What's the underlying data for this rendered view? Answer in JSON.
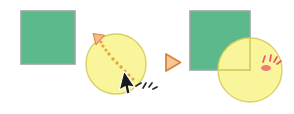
{
  "diagram": {
    "title": "Drag circle onto square corner",
    "type": "before-after-illustration",
    "width": 294,
    "height": 114,
    "background_color": "#ffffff"
  },
  "colors": {
    "square_fill": "#5cb98b",
    "square_stroke": "#9aa79f",
    "circle_fill": "#f9f59a",
    "circle_stroke": "#d8cf63",
    "trail_dot": "#e8a33d",
    "arrowhead": "#f0a35e",
    "cursor_fill": "#1a1a1a",
    "cursor_stroke": "#ffffff",
    "separator_fill": "#f6c28a",
    "separator_stroke": "#d4873c",
    "impact_mark": "#e8556b",
    "motion_mark": "#2b2b2b",
    "quadrant_line": "#cfc45e"
  },
  "before_panel": {
    "label": "before",
    "square": {
      "name": "green-square",
      "x": 21,
      "y": 11,
      "width": 54,
      "height": 53
    },
    "circle": {
      "name": "yellow-circle",
      "cx": 116,
      "cy": 64,
      "r": 30
    },
    "drag_trail": {
      "label": "drag path",
      "dots": [
        {
          "x": 133,
          "y": 79,
          "r": 1.6
        },
        {
          "x": 129,
          "y": 75,
          "r": 1.6
        },
        {
          "x": 125,
          "y": 71,
          "r": 1.6
        },
        {
          "x": 121,
          "y": 67,
          "r": 1.7
        },
        {
          "x": 117,
          "y": 63,
          "r": 1.7
        },
        {
          "x": 113,
          "y": 59,
          "r": 1.7
        },
        {
          "x": 109,
          "y": 54,
          "r": 1.7
        },
        {
          "x": 106,
          "y": 50,
          "r": 1.6
        },
        {
          "x": 103,
          "y": 46,
          "r": 1.6
        },
        {
          "x": 101,
          "y": 42,
          "r": 1.5
        }
      ],
      "arrowhead": {
        "x": 97,
        "y": 37,
        "rotation": -48
      }
    },
    "cursor": {
      "name": "mouse-cursor",
      "x": 124,
      "y": 71
    },
    "motion_marks": [
      {
        "x1": 136,
        "y1": 86,
        "x2": 141,
        "y2": 83
      },
      {
        "x1": 143,
        "y1": 88,
        "x2": 146,
        "y2": 83
      },
      {
        "x1": 149,
        "y1": 87,
        "x2": 152,
        "y2": 83
      },
      {
        "x1": 153,
        "y1": 89,
        "x2": 157,
        "y2": 87
      }
    ]
  },
  "separator": {
    "name": "play-triangle-separator",
    "label": "then",
    "glyph": "play-triangle",
    "x": 166,
    "y": 54,
    "size": 17
  },
  "after_panel": {
    "label": "after",
    "square": {
      "name": "green-square",
      "x": 190,
      "y": 11,
      "width": 60,
      "height": 59
    },
    "circle": {
      "name": "yellow-circle",
      "cx": 250,
      "cy": 70,
      "r": 32
    },
    "quadrant_lines": [
      {
        "name": "vertical-guide",
        "x1": 250,
        "y1": 38,
        "x2": 250,
        "y2": 70
      },
      {
        "name": "horizontal-guide",
        "x1": 218,
        "y1": 70,
        "x2": 250,
        "y2": 70
      }
    ],
    "impact_marks": [
      {
        "x1": 265,
        "y1": 56,
        "x2": 263,
        "y2": 62
      },
      {
        "x1": 271,
        "y1": 55,
        "x2": 270,
        "y2": 61
      },
      {
        "x1": 277,
        "y1": 57,
        "x2": 274,
        "y2": 62
      },
      {
        "x1": 281,
        "y1": 61,
        "x2": 277,
        "y2": 64
      }
    ],
    "snap_blob": {
      "cx": 266,
      "cy": 68,
      "rx": 5,
      "ry": 3
    }
  }
}
